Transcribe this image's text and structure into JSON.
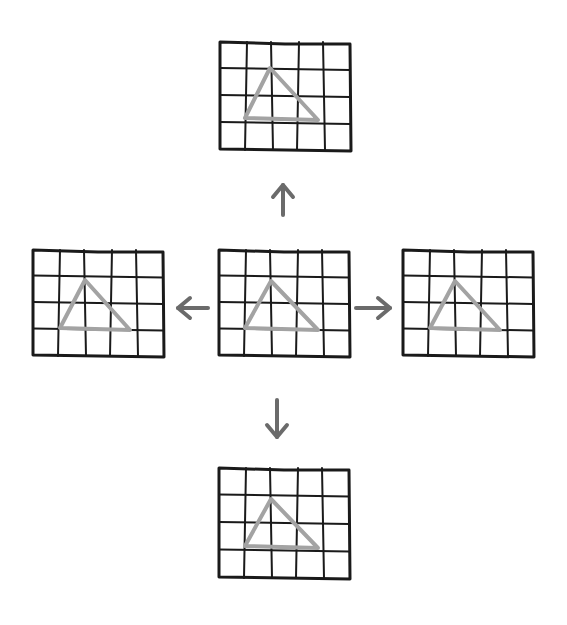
{
  "diagram": {
    "grid": {
      "columns": 5,
      "rows": 4
    },
    "colors": {
      "grid_line": "#1a1a1a",
      "triangle": "#a3a3a3",
      "arrow": "#6b6b6b",
      "background": "#ffffff"
    },
    "panels": [
      {
        "id": "top",
        "x": 220,
        "y": 42,
        "w": 130,
        "h": 108,
        "triangle": [
          [
            270,
            68
          ],
          [
            245,
            118
          ],
          [
            318,
            120
          ]
        ]
      },
      {
        "id": "left",
        "x": 33,
        "y": 250,
        "w": 130,
        "h": 106,
        "triangle": [
          [
            85,
            280
          ],
          [
            60,
            328
          ],
          [
            130,
            330
          ]
        ]
      },
      {
        "id": "center",
        "x": 219,
        "y": 250,
        "w": 130,
        "h": 106,
        "triangle": [
          [
            271,
            281
          ],
          [
            245,
            328
          ],
          [
            318,
            330
          ]
        ]
      },
      {
        "id": "right",
        "x": 403,
        "y": 250,
        "w": 130,
        "h": 106,
        "triangle": [
          [
            455,
            281
          ],
          [
            430,
            328
          ],
          [
            500,
            330
          ]
        ]
      },
      {
        "id": "bottom",
        "x": 219,
        "y": 468,
        "w": 130,
        "h": 110,
        "triangle": [
          [
            271,
            499
          ],
          [
            245,
            546
          ],
          [
            318,
            548
          ]
        ]
      }
    ],
    "arrows": [
      {
        "direction": "up",
        "x1": 283,
        "y1": 215,
        "x2": 283,
        "y2": 185
      },
      {
        "direction": "left",
        "x1": 208,
        "y1": 308,
        "x2": 178,
        "y2": 308
      },
      {
        "direction": "right",
        "x1": 356,
        "y1": 308,
        "x2": 390,
        "y2": 308
      },
      {
        "direction": "down",
        "x1": 277,
        "y1": 400,
        "x2": 277,
        "y2": 437
      }
    ]
  }
}
